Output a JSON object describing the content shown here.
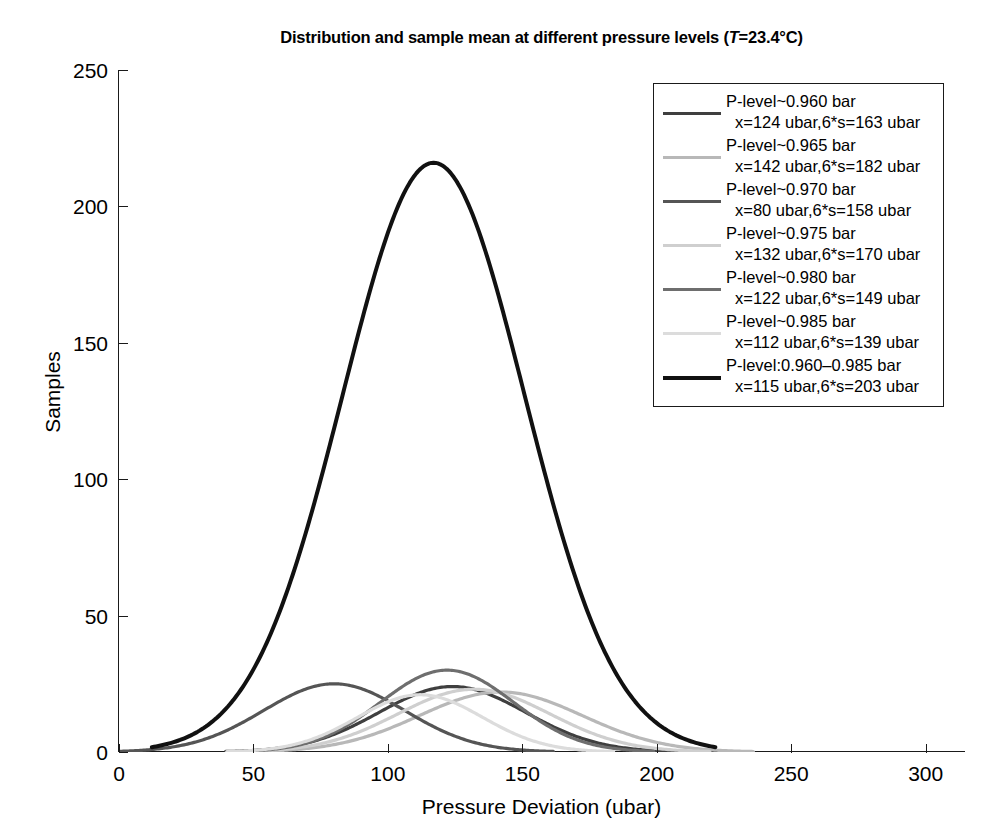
{
  "chart_data": {
    "type": "line",
    "title": "Distribution and sample mean at different pressure levels (T=23.4°C)",
    "title_prefix": "Distribution and sample mean at different pressure levels (",
    "title_italic": "T",
    "title_suffix": "=23.4°C)",
    "xlabel": "Pressure Deviation (ubar)",
    "ylabel": "Samples",
    "xlim": [
      0,
      315
    ],
    "ylim": [
      0,
      250
    ],
    "xticks": [
      0,
      50,
      100,
      150,
      200,
      250,
      300
    ],
    "yticks": [
      0,
      50,
      100,
      150,
      200,
      250
    ],
    "grid": false,
    "legend_position": "top-right",
    "curve_shape": "gaussian",
    "note": "Each series is a Gaussian: mean = x (ubar), width parameter 6*s (ubar), peak = peak_samples",
    "series": [
      {
        "name": "P-level~0.960 bar",
        "label_line1": "P-level~0.960 bar",
        "label_line2": "x=124 ubar,6*s=163 ubar",
        "mean": 124,
        "six_sigma": 163,
        "sigma": 27.2,
        "peak_samples": 24,
        "color": "#3f3f3f",
        "width": 3.2
      },
      {
        "name": "P-level~0.965 bar",
        "label_line1": "P-level~0.965 bar",
        "label_line2": "x=142 ubar,6*s=182 ubar",
        "mean": 142,
        "six_sigma": 182,
        "sigma": 30.3,
        "peak_samples": 22,
        "color": "#b8b8b8",
        "width": 3.2
      },
      {
        "name": "P-level~0.970 bar",
        "label_line1": "P-level~0.970 bar",
        "label_line2": "x=80 ubar,6*s=158 ubar",
        "mean": 80,
        "six_sigma": 158,
        "sigma": 26.3,
        "peak_samples": 25,
        "color": "#555555",
        "width": 3.2
      },
      {
        "name": "P-level~0.975 bar",
        "label_line1": "P-level~0.975 bar",
        "label_line2": "x=132 ubar,6*s=170 ubar",
        "mean": 132,
        "six_sigma": 170,
        "sigma": 28.3,
        "peak_samples": 23,
        "color": "#cfcfcf",
        "width": 3.2
      },
      {
        "name": "P-level~0.980 bar",
        "label_line1": "P-level~0.980 bar",
        "label_line2": "x=122 ubar,6*s=149 ubar",
        "mean": 122,
        "six_sigma": 149,
        "sigma": 24.8,
        "peak_samples": 30,
        "color": "#6e6e6e",
        "width": 3.2
      },
      {
        "name": "P-level~0.985 bar",
        "label_line1": "P-level~0.985 bar",
        "label_line2": "x=112 ubar,6*s=139 ubar",
        "mean": 112,
        "six_sigma": 139,
        "sigma": 23.2,
        "peak_samples": 21,
        "color": "#dcdcdc",
        "width": 3.2
      },
      {
        "name": "P-level:0.960-0.985 bar",
        "label_line1": "P-level:0.960–0.985 bar",
        "label_line2": "x=115 ubar,6*s=203 ubar",
        "mean": 117,
        "six_sigma": 203,
        "sigma": 33.8,
        "peak_samples": 216,
        "color": "#111111",
        "width": 4.0
      }
    ]
  },
  "axis": {
    "x_tick_labels": [
      "0",
      "50",
      "100",
      "150",
      "200",
      "250",
      "300"
    ],
    "y_tick_labels": [
      "0",
      "50",
      "100",
      "150",
      "200",
      "250"
    ]
  }
}
